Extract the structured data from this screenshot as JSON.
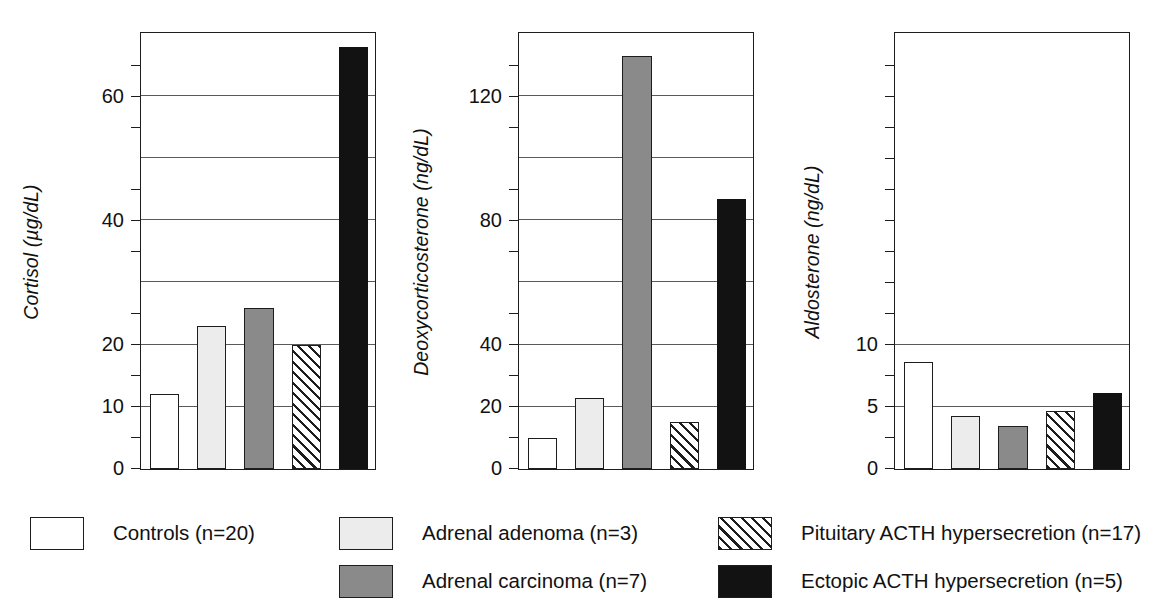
{
  "figure": {
    "background": "#ffffff",
    "ink": "#1d1d1d",
    "gridline_color": "#5a5a5a"
  },
  "groups": [
    {
      "key": "controls",
      "label": "Controls (n=20)",
      "swatch": "white",
      "color": "#ffffff"
    },
    {
      "key": "adenoma",
      "label": "Adrenal adenoma (n=3)",
      "swatch": "light",
      "color": "#ececec"
    },
    {
      "key": "carcinoma",
      "label": "Adrenal carcinoma (n=7)",
      "swatch": "dark",
      "color": "#8a8a8a"
    },
    {
      "key": "pituitary",
      "label": "Pituitary ACTH hypersecretion (n=17)",
      "swatch": "hatch",
      "color": "#ffffff"
    },
    {
      "key": "ectopic",
      "label": "Ectopic ACTH hypersecretion (n=5)",
      "swatch": "black",
      "color": "#121212"
    }
  ],
  "legend": {
    "items": [
      {
        "label": "Controls (n=20)",
        "swatch": "white"
      },
      {
        "label": "Adrenal adenoma (n=3)",
        "swatch": "light"
      },
      {
        "label": "Adrenal carcinoma (n=7)",
        "swatch": "dark"
      },
      {
        "label": "Pituitary ACTH hypersecretion (n=17)",
        "swatch": "hatch"
      },
      {
        "label": "Ectopic ACTH hypersecretion (n=5)",
        "swatch": "black"
      }
    ]
  },
  "chart_data": [
    {
      "type": "bar",
      "title": "",
      "ylabel": "Cortisol (µg/dL)",
      "xlabel": "",
      "yunit": "µg/dL",
      "categories": [
        "Controls (n=20)",
        "Adrenal adenoma (n=3)",
        "Adrenal carcinoma (n=7)",
        "Pituitary ACTH hypersecretion (n=17)",
        "Ectopic ACTH hypersecretion (n=5)"
      ],
      "values": [
        12,
        23,
        26,
        20,
        68
      ],
      "ylim": [
        0,
        70
      ],
      "yticks_labeled": [
        0,
        10,
        20,
        40,
        60
      ],
      "ytick_labels": [
        "0",
        "10",
        "20",
        "40",
        "60"
      ],
      "gridlines": [
        10,
        20,
        30,
        40,
        50,
        60
      ],
      "minor_ticks": [
        5,
        15,
        25,
        35,
        45,
        55,
        65
      ],
      "grid": true,
      "legend_position": "bottom"
    },
    {
      "type": "bar",
      "title": "",
      "ylabel": "Deoxycorticosterone (ng/dL)",
      "xlabel": "",
      "yunit": "ng/dL",
      "categories": [
        "Controls (n=20)",
        "Adrenal adenoma (n=3)",
        "Adrenal carcinoma (n=7)",
        "Pituitary ACTH hypersecretion (n=17)",
        "Ectopic ACTH hypersecretion (n=5)"
      ],
      "values": [
        10,
        23,
        133,
        15,
        87
      ],
      "ylim": [
        0,
        140
      ],
      "yticks_labeled": [
        0,
        20,
        40,
        80,
        120
      ],
      "ytick_labels": [
        "0",
        "20",
        "40",
        "80",
        "120"
      ],
      "gridlines": [
        20,
        40,
        60,
        80,
        100,
        120
      ],
      "minor_ticks": [
        10,
        30,
        50,
        70,
        90,
        110,
        130
      ],
      "grid": true,
      "legend_position": "bottom"
    },
    {
      "type": "bar",
      "title": "",
      "ylabel": "Aldosterone (ng/dL)",
      "xlabel": "",
      "yunit": "ng/dL",
      "categories": [
        "Controls (n=20)",
        "Adrenal adenoma (n=3)",
        "Adrenal carcinoma (n=7)",
        "Pituitary ACTH hypersecretion (n=17)",
        "Ectopic ACTH hypersecretion (n=5)"
      ],
      "values": [
        8.6,
        4.3,
        3.5,
        4.7,
        6.1
      ],
      "ylim": [
        0,
        35
      ],
      "yticks_labeled": [
        0,
        5,
        10
      ],
      "ytick_labels": [
        "0",
        "5",
        "10"
      ],
      "gridlines": [
        5,
        10
      ],
      "minor_ticks": [
        2.5,
        7.5,
        12.5,
        15,
        17.5,
        20,
        22.5,
        25,
        27.5,
        30,
        32.5
      ],
      "grid": true,
      "legend_position": "bottom"
    }
  ]
}
